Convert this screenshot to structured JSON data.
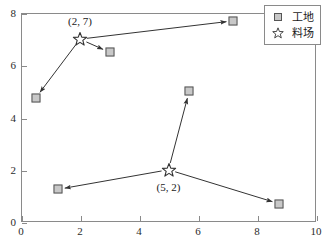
{
  "chart_data": {
    "type": "scatter",
    "title": "",
    "xlabel": "",
    "ylabel": "",
    "xlim": [
      0,
      10
    ],
    "ylim": [
      0,
      8
    ],
    "xticks": [
      0,
      2,
      4,
      6,
      8,
      10
    ],
    "yticks": [
      0,
      2,
      4,
      6,
      8
    ],
    "grid": false,
    "legend_position": "upper right",
    "colors": {
      "site_fill": "#c8c8c8",
      "site_edge": "#555555",
      "depot_edge": "#333333",
      "arrow": "#333333",
      "axis": "#8a8a8a",
      "text": "#1a1a1a"
    },
    "series": [
      {
        "name": "工地",
        "marker": "square",
        "points": [
          {
            "x": 0.5,
            "y": 4.75
          },
          {
            "x": 3.0,
            "y": 6.5
          },
          {
            "x": 7.2,
            "y": 7.7
          },
          {
            "x": 5.7,
            "y": 5.0
          },
          {
            "x": 1.25,
            "y": 1.25
          },
          {
            "x": 8.75,
            "y": 0.7
          }
        ]
      },
      {
        "name": "料场",
        "marker": "star",
        "points": [
          {
            "x": 2,
            "y": 7,
            "label": "(2, 7)"
          },
          {
            "x": 5,
            "y": 2,
            "label": "(5, 2)"
          }
        ]
      }
    ],
    "arrows": [
      {
        "from": {
          "x": 2,
          "y": 7
        },
        "to": {
          "x": 0.5,
          "y": 4.75
        }
      },
      {
        "from": {
          "x": 2,
          "y": 7
        },
        "to": {
          "x": 3.0,
          "y": 6.5
        }
      },
      {
        "from": {
          "x": 2,
          "y": 7
        },
        "to": {
          "x": 7.2,
          "y": 7.7
        }
      },
      {
        "from": {
          "x": 5,
          "y": 2
        },
        "to": {
          "x": 5.7,
          "y": 5.0
        }
      },
      {
        "from": {
          "x": 5,
          "y": 2
        },
        "to": {
          "x": 1.25,
          "y": 1.25
        }
      },
      {
        "from": {
          "x": 5,
          "y": 2
        },
        "to": {
          "x": 8.75,
          "y": 0.7
        }
      }
    ],
    "annotations": [
      {
        "text": "(2, 7)",
        "x": 2,
        "y": 7,
        "placement": "above"
      },
      {
        "text": "(5, 2)",
        "x": 5,
        "y": 2,
        "placement": "below"
      }
    ]
  },
  "legend": {
    "entries": [
      {
        "label": "工地",
        "marker": "square"
      },
      {
        "label": "料场",
        "marker": "star"
      }
    ]
  }
}
